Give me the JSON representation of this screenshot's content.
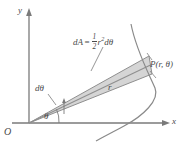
{
  "figure": {
    "background_color": "#ffffff",
    "axis_color": "#7a7a7a",
    "curve_color": "#8a8a8a",
    "wedge_fill_color": "#c9c9c9",
    "wedge_edge_color": "#8f8f8f",
    "label_color": "#4a4a4a",
    "axes": {
      "x_label": "x",
      "y_label": "y",
      "origin_label": "O"
    },
    "labels": {
      "angle": "θ",
      "angle_differential": "dθ",
      "radius": "r",
      "point": "P(r, θ)"
    },
    "formula": {
      "lhs": "dA",
      "equals": "=",
      "fraction_numerator": "1",
      "fraction_denominator": "2",
      "radius_symbol": "r",
      "radius_exponent": "2",
      "angle_differential": "dθ"
    }
  }
}
